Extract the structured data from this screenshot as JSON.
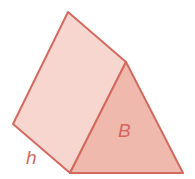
{
  "diagram": {
    "labels": {
      "base": "B",
      "height": "h"
    },
    "colors": {
      "stroke": "#d46a5f",
      "side_face": "#f6d6cf",
      "base_face": "#efb9ae",
      "label": "#d4685e"
    },
    "vertices": {
      "top_back": [
        68,
        12
      ],
      "apex_front": [
        126,
        62
      ],
      "left_back": [
        13,
        124
      ],
      "bottom_front_left": [
        70,
        173
      ],
      "bottom_front_right": [
        183,
        173
      ]
    }
  }
}
